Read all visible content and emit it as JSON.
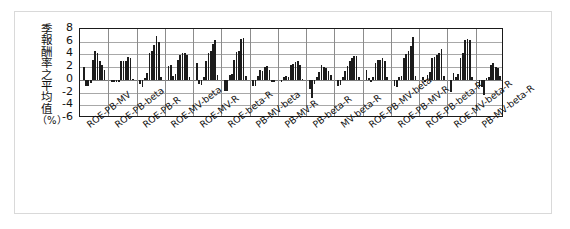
{
  "figure": {
    "ylabel": "季報酬率之平均值（%）",
    "ylabel_chars": [
      "季",
      "報",
      "酬",
      "率",
      "之",
      "平",
      "均",
      "值",
      "（%）"
    ]
  },
  "chart_data": {
    "type": "bar",
    "title": "",
    "xlabel": "",
    "ylabel": "季報酬率之平均值（%）",
    "ylim": [
      -6,
      8
    ],
    "yticks": [
      8,
      6,
      4,
      2,
      0,
      -2,
      -4,
      -6
    ],
    "grid": true,
    "legend": "none",
    "categories": [
      "ROE-PB-MV",
      "ROE-PB-beta",
      "ROE-PB-R",
      "ROE-MV-beta",
      "ROE-MV-R",
      "ROE-beta-R",
      "PB-MV-beta",
      "PB-MV-R",
      "PB-beta-R",
      "MV-beta-R",
      "ROE-PB-MV-beta",
      "ROE-PB-MV-R",
      "ROE-PB-beta-R",
      "ROE-MV-beta-R",
      "PB-MV-beta-R"
    ],
    "groups": [
      {
        "category": "ROE-PB-MV",
        "values": [
          2.1,
          -0.9,
          -1.0,
          -0.5,
          3.2,
          4.6,
          4.3,
          3.0,
          2.4,
          1.6
        ]
      },
      {
        "category": "ROE-PB-beta",
        "values": [
          -0.4,
          -0.4,
          -0.4,
          -0.3,
          3.0,
          3.0,
          2.9,
          3.6,
          3.4,
          0.2
        ]
      },
      {
        "category": "ROE-PB-R",
        "values": [
          -0.6,
          -1.1,
          0.3,
          1.1,
          4.2,
          4.6,
          5.5,
          6.9,
          6.0,
          0.4
        ]
      },
      {
        "category": "ROE-MV-beta",
        "values": [
          2.2,
          2.3,
          0.6,
          1.0,
          3.2,
          3.9,
          4.2,
          4.3,
          3.9,
          0.4
        ]
      },
      {
        "category": "ROE-MV-R",
        "values": [
          2.6,
          -0.6,
          -0.8,
          0.5,
          3.0,
          4.3,
          4.5,
          5.7,
          6.2,
          0.7
        ]
      },
      {
        "category": "ROE-beta-R",
        "values": [
          -1.8,
          -1.7,
          0.8,
          1.0,
          3.2,
          4.4,
          4.5,
          6.4,
          6.6,
          0.6
        ]
      },
      {
        "category": "PB-MV-beta",
        "values": [
          -1.0,
          -0.9,
          0.6,
          1.6,
          1.4,
          2.0,
          2.2,
          1.6,
          -0.4,
          -0.3
        ]
      },
      {
        "category": "PB-MV-R",
        "values": [
          -0.3,
          0.5,
          0.6,
          0.4,
          2.3,
          2.5,
          2.8,
          3.0,
          2.4,
          0.2
        ]
      },
      {
        "category": "PB-beta-R",
        "values": [
          -1.5,
          -2.9,
          -0.6,
          0.4,
          1.2,
          2.3,
          2.1,
          1.8,
          1.4,
          0.7
        ]
      },
      {
        "category": "MV-beta-R",
        "values": [
          -0.9,
          -0.8,
          0.5,
          1.4,
          2.2,
          3.0,
          3.4,
          3.8,
          3.7,
          0.4
        ]
      },
      {
        "category": "ROE-PB-MV-beta",
        "values": [
          1.6,
          0.3,
          -0.3,
          0.4,
          2.6,
          3.1,
          3.2,
          3.4,
          2.9,
          0.5
        ]
      },
      {
        "category": "ROE-PB-MV-R",
        "values": [
          -1.0,
          -1.1,
          0.4,
          0.6,
          3.4,
          4.0,
          4.6,
          5.4,
          6.8,
          0.6
        ]
      },
      {
        "category": "ROE-PB-beta-R",
        "values": [
          0.5,
          -0.4,
          0.7,
          1.2,
          3.4,
          3.6,
          3.9,
          4.2,
          4.9,
          0.6
        ]
      },
      {
        "category": "ROE-MV-beta-R",
        "values": [
          -1.9,
          1.1,
          0.4,
          0.9,
          3.4,
          4.2,
          6.3,
          6.4,
          6.3,
          0.5
        ]
      },
      {
        "category": "PB-MV-beta-R",
        "values": [
          -1.1,
          -1.2,
          -2.4,
          0.3,
          0.4,
          2.4,
          2.6,
          2.1,
          1.8,
          0.6
        ]
      }
    ]
  }
}
